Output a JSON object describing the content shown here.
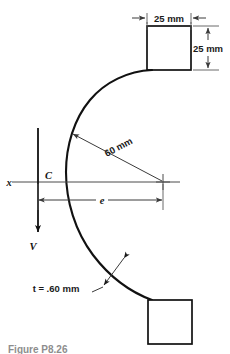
{
  "figure": {
    "caption": "Figure P8.26",
    "dimensions": {
      "flange_width": "25 mm",
      "flange_height": "25 mm",
      "radius": "60 mm",
      "thickness": "t = .60 mm"
    },
    "labels": {
      "axis": "x",
      "centroid": "C",
      "shear_force": "V",
      "eccentricity": "e"
    },
    "colors": {
      "outline": "#111111",
      "dimension": "#3a3a3a",
      "caption": "#8d8d8d",
      "background": "#ffffff"
    }
  }
}
